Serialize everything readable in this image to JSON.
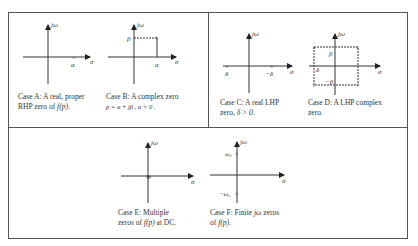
{
  "axis_labels": {
    "real": "σ",
    "imag": "jω"
  },
  "panels": [
    {
      "id": "A",
      "case_label": "Case A",
      "caption_line1": ": A real, proper",
      "caption_line2_prefix": "RHP zero of ",
      "caption_line2_math": "f(p)",
      "caption_line2_suffix": ".",
      "markers": [
        "α"
      ]
    },
    {
      "id": "B",
      "case_label": "Case B",
      "caption_line1": ": A complex zero",
      "caption_line2_math": "p = α + jβ ,  α > 0 .",
      "markers": [
        "β",
        "α"
      ]
    },
    {
      "id": "C",
      "case_label": "Case C",
      "caption_line1": ": A real LHP",
      "caption_line2_prefix": "zero,  ",
      "caption_line2_math": "δ > 0",
      "caption_line2_suffix": ".",
      "markers": [
        "δ",
        "−δ"
      ]
    },
    {
      "id": "D",
      "case_label": "Case D",
      "caption_line1": ": A LHP complex",
      "caption_line2_prefix": "zero.",
      "markers": [
        "β",
        "δ",
        "−β"
      ]
    },
    {
      "id": "E",
      "case_label": "Case E",
      "caption_line1": ": Multiple",
      "caption_line2_prefix": "zeros of  ",
      "caption_line2_math": "f(p)",
      "caption_line2_suffix": "  at DC.",
      "markers": []
    },
    {
      "id": "F",
      "case_label": "Case F",
      "caption_line1_prefix": ": Finite  ",
      "caption_line1_math": "jω",
      "caption_line1_suffix": "  zeros",
      "caption_line2_prefix": "of  ",
      "caption_line2_math": "f(p)",
      "caption_line2_suffix": ".",
      "markers": [
        "ω₀",
        "−ω₀"
      ]
    }
  ]
}
